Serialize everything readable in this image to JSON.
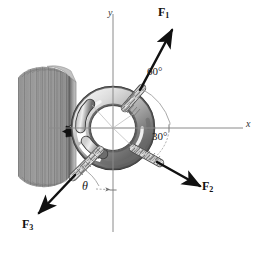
{
  "figure": {
    "name": "eye-bolt-three-force-diagram",
    "background": "#ffffff",
    "width": 265,
    "height": 253
  },
  "axes": {
    "x_label": "x",
    "y_label": "y",
    "origin": {
      "x": 113,
      "y": 128
    },
    "color": "#8a8a8a",
    "x_start": {
      "x": 48,
      "y": 128
    },
    "x_end": {
      "x": 243,
      "y": 128
    },
    "y_start": {
      "x": 113,
      "y": 14
    },
    "y_end": {
      "x": 113,
      "y": 232
    }
  },
  "wall": {
    "name": "wood-wall",
    "fill": "#9a9a9a",
    "edge": "#6f6f6f",
    "grain_color": "#6a6a6a",
    "face_light": "#b9b9b9"
  },
  "ring": {
    "name": "eye-bolt-ring",
    "center": {
      "x": 113,
      "y": 128
    },
    "radius": 32,
    "tube": 9,
    "highlight": "#efefef",
    "mid": "#b4b4b4",
    "shadow": "#6e6e6e",
    "outline": "#3c3c3c"
  },
  "ropes": {
    "color_light": "#d8d8d8",
    "color_mid": "#a8a8a8",
    "color_dark": "#5e5e5e",
    "arrow_color": "#111111"
  },
  "forces": [
    {
      "id": "F1",
      "label": "F",
      "subscript": "1",
      "label_pos": {
        "x": 162,
        "y": 12
      },
      "angle_deg": 60,
      "direction": "up-right",
      "tail": {
        "x": 129,
        "y": 102
      },
      "tip": {
        "x": 172,
        "y": 29
      }
    },
    {
      "id": "F2",
      "label": "F",
      "subscript": "2",
      "label_pos": {
        "x": 204,
        "y": 182
      },
      "angle_deg": -30,
      "direction": "down-right",
      "tail": {
        "x": 134,
        "y": 152
      },
      "tip": {
        "x": 200,
        "y": 188
      }
    },
    {
      "id": "F3",
      "label": "F",
      "subscript": "3",
      "label_pos": {
        "x": 26,
        "y": 222
      },
      "angle_label": "theta",
      "direction": "down-left",
      "tail": {
        "x": 92,
        "y": 157
      },
      "tip": {
        "x": 38,
        "y": 214
      }
    }
  ],
  "angles": [
    {
      "id": "angle-60",
      "text": "60°",
      "label_pos": {
        "x": 152,
        "y": 73
      },
      "arc_color": "#9a9a9a",
      "from": "F1-rope",
      "to": "x-axis"
    },
    {
      "id": "angle-30",
      "text": "30°",
      "label_pos": {
        "x": 157,
        "y": 137
      },
      "arc_color": "#9a9a9a",
      "from": "x-axis",
      "to": "F2-rope"
    },
    {
      "id": "angle-theta",
      "text": "θ",
      "label_pos": {
        "x": 85,
        "y": 186
      },
      "arc_color": "#9a9a9a",
      "from": "F3-rope",
      "to": "negative-y-axis"
    }
  ],
  "tick_marks": [
    {
      "id": "tick-x-60",
      "x": 169,
      "y": 128
    },
    {
      "id": "tick-x-30",
      "x": 169,
      "y": 128
    },
    {
      "id": "tick-y-theta",
      "x": 113,
      "y": 190
    }
  ]
}
